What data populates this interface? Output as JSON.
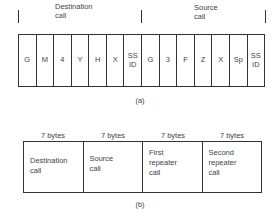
{
  "figure_a": {
    "groups": [
      {
        "label_line1": "Destination",
        "label_line2": "call"
      },
      {
        "label_line1": "Source",
        "label_line2": "call"
      }
    ],
    "cells": [
      "G",
      "M",
      "4",
      "Y",
      "H",
      "X",
      "SS\nID",
      "G",
      "3",
      "F",
      "Z",
      "X",
      "Sp",
      "SS\nID"
    ],
    "caption": "(a)"
  },
  "figure_b": {
    "columns": [
      {
        "size": "7 bytes",
        "label": "Destination\ncall"
      },
      {
        "size": "7 bytes",
        "label": "Source\ncall"
      },
      {
        "size": "7 bytes",
        "label": "First\nrepeater\ncall"
      },
      {
        "size": "7 bytes",
        "label": "Second\nrepeater\ncall"
      }
    ],
    "caption": "(b)"
  }
}
